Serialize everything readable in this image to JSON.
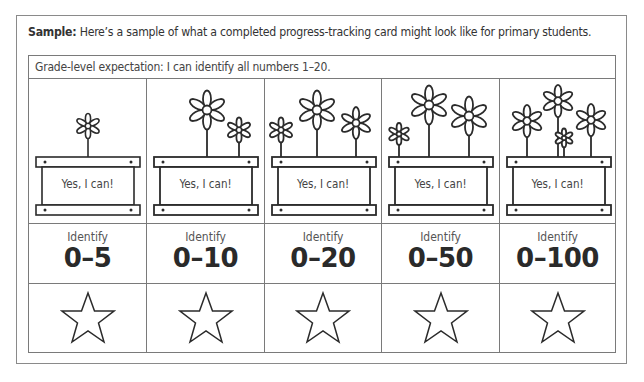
{
  "intro": {
    "label": "Sample:",
    "text": " Here’s a sample of what a completed progress-tracking card might look like for primary students."
  },
  "card": {
    "expectation": "Grade-level expectation: I can identify all numbers 1–20.",
    "columns": [
      {
        "planter_text": "Yes, I can!",
        "label": "Identify",
        "range": "0–5",
        "flowers": 1,
        "icon": "star-outline-icon"
      },
      {
        "planter_text": "Yes, I can!",
        "label": "Identify",
        "range": "0–10",
        "flowers": 2,
        "icon": "star-outline-icon"
      },
      {
        "planter_text": "Yes, I can!",
        "label": "Identify",
        "range": "0–20",
        "flowers": 3,
        "icon": "star-outline-icon"
      },
      {
        "planter_text": "Yes, I can!",
        "label": "Identify",
        "range": "0–50",
        "flowers": 3,
        "icon": "star-outline-icon"
      },
      {
        "planter_text": "Yes, I can!",
        "label": "Identify",
        "range": "0–100",
        "flowers": 4,
        "icon": "star-outline-icon"
      }
    ]
  },
  "colors": {
    "line": "#2b2b2b",
    "border": "#7a7a7a",
    "background": "#ffffff"
  }
}
